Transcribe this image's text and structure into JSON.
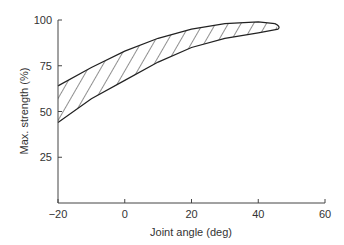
{
  "chart_data": {
    "type": "area",
    "title": "",
    "xlabel": "Joint angle (deg)",
    "ylabel": "Max. strength (%)",
    "xlim": [
      -20,
      60
    ],
    "ylim": [
      0,
      100
    ],
    "xticks": [
      -20,
      0,
      20,
      40,
      60
    ],
    "yticks": [
      25,
      50,
      75,
      100
    ],
    "grid": false,
    "legend": null,
    "fill": "hatched band",
    "series": [
      {
        "name": "upper bound",
        "x": [
          -20,
          -10,
          0,
          10,
          20,
          30,
          40,
          45
        ],
        "values": [
          64,
          74,
          83,
          90,
          95,
          98,
          99,
          98
        ]
      },
      {
        "name": "lower bound",
        "x": [
          -20,
          -10,
          0,
          10,
          20,
          30,
          40,
          46
        ],
        "values": [
          44,
          57,
          67,
          77,
          85,
          90,
          93,
          95
        ]
      }
    ]
  }
}
